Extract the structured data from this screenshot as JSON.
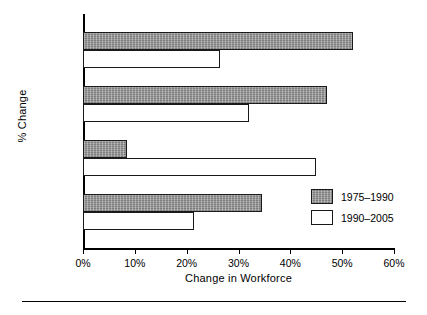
{
  "chart_data": {
    "type": "bar",
    "orientation": "horizontal",
    "title": "",
    "xlabel": "Change in Workforce",
    "ylabel": "% Change",
    "categories": [
      "Women",
      "Blacks",
      "Age 55+",
      "Total"
    ],
    "series": [
      {
        "name": "1975–1990",
        "values": [
          52,
          47,
          8.5,
          34.5
        ],
        "fill": "#8c8c8c"
      },
      {
        "name": "1990–2005",
        "values": [
          26.5,
          32,
          45,
          21.5
        ],
        "fill": "#ffffff"
      }
    ],
    "xlim": [
      0,
      60
    ],
    "xticks": [
      0,
      10,
      20,
      30,
      40,
      50,
      60
    ],
    "xtick_labels": [
      "0%",
      "10%",
      "20%",
      "30%",
      "40%",
      "50%",
      "60%"
    ],
    "grid": false,
    "legend_position": "center-right"
  },
  "legend": {
    "entries": [
      {
        "label": "1975–1990"
      },
      {
        "label": "1990–2005"
      }
    ]
  }
}
